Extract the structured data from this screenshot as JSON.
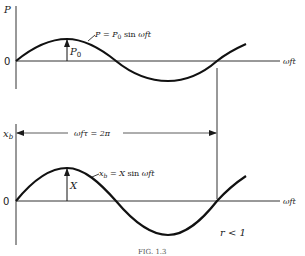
{
  "figure": {
    "top_plot": {
      "y_axis_label": "P",
      "origin_label": "0",
      "x_axis_label": "ωft",
      "amplitude_label": "P0",
      "curve_label": "P = P0 sin ωft",
      "curve_label_parts": {
        "lhs": "P = P",
        "sub": "0",
        "rhs": " sin ωft"
      }
    },
    "period_marker": {
      "label": "ωfτ = 2π",
      "label_parts": {
        "a": "ωfτ = 2π"
      }
    },
    "bottom_plot": {
      "y_axis_label": "xb",
      "y_axis_label_parts": {
        "main": "x",
        "sub": "b"
      },
      "origin_label": "0",
      "x_axis_label": "ωft",
      "amplitude_label": "X",
      "curve_label": "xb = X sin ωft",
      "curve_label_parts": {
        "main": "x",
        "sub": "b",
        "rest": " = X sin ωft"
      },
      "condition_label": "r < 1"
    },
    "caption": "FIG. 1.3"
  }
}
